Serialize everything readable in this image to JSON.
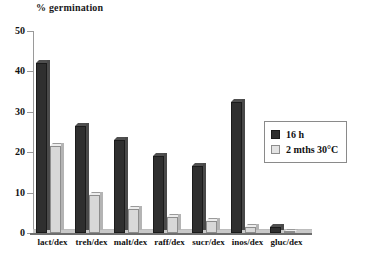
{
  "chart_data": {
    "type": "bar",
    "title": "% germination",
    "xlabel": "",
    "ylabel": "",
    "ylim": [
      0,
      50
    ],
    "yticks": [
      0,
      10,
      20,
      30,
      40,
      50
    ],
    "grid": false,
    "legend_position": "right",
    "categories": [
      "lact/dex",
      "treh/dex",
      "malt/dex",
      "raff/dex",
      "sucr/dex",
      "inos/dex",
      "gluc/dex"
    ],
    "series": [
      {
        "name": "16 h",
        "color": "#2f2f2f",
        "values": [
          42,
          26.5,
          23,
          19,
          16.5,
          32.5,
          1.5
        ]
      },
      {
        "name": "2 mths 30°C",
        "color": "#d8d8d8",
        "values": [
          21.5,
          9.5,
          6,
          4,
          3,
          1.5,
          0.3
        ]
      }
    ]
  },
  "legend": {
    "items": [
      {
        "label": "16 h"
      },
      {
        "label": "2 mths 30°C"
      }
    ]
  }
}
